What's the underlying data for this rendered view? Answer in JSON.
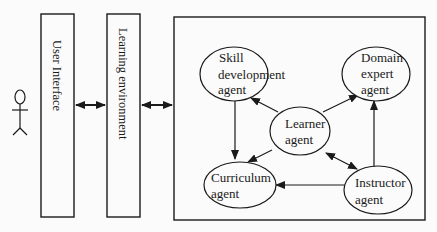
{
  "diagram": {
    "actor": {
      "name": "user-actor"
    },
    "columns": [
      {
        "id": "user_interface",
        "label": "User Interface"
      },
      {
        "id": "learning_environment",
        "label": "Learning environment"
      }
    ],
    "agents": [
      {
        "id": "skill",
        "lines": [
          "Skill",
          "development",
          "agent"
        ]
      },
      {
        "id": "domain",
        "lines": [
          "Domain",
          "expert",
          "agent"
        ]
      },
      {
        "id": "learner",
        "lines": [
          "Learner",
          "agent"
        ]
      },
      {
        "id": "curriculum",
        "lines": [
          "Curriculum",
          "agent"
        ]
      },
      {
        "id": "instructor",
        "lines": [
          "Instructor",
          "agent"
        ]
      }
    ],
    "edges": [
      {
        "from": "user_interface",
        "to": "learning_environment",
        "type": "bidirectional"
      },
      {
        "from": "learning_environment",
        "to": "agent_system",
        "type": "bidirectional"
      },
      {
        "from": "learner",
        "to": "skill",
        "type": "directed"
      },
      {
        "from": "learner",
        "to": "domain",
        "type": "directed"
      },
      {
        "from": "learner",
        "to": "curriculum",
        "type": "directed"
      },
      {
        "from": "learner",
        "to": "instructor",
        "type": "bidirectional"
      },
      {
        "from": "skill",
        "to": "curriculum",
        "type": "directed"
      },
      {
        "from": "instructor",
        "to": "curriculum",
        "type": "directed"
      },
      {
        "from": "instructor",
        "to": "domain",
        "type": "directed"
      }
    ]
  }
}
